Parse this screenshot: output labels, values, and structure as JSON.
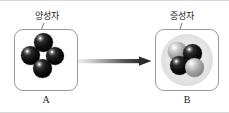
{
  "figure": {
    "type": "science-diagram",
    "background_color": "#ffffff",
    "border_color": "#d8d8d8"
  },
  "callouts": [
    {
      "id": "proton",
      "text": "양성자",
      "points_to": "panel-a-top-sphere",
      "color": "#1a1a1a"
    },
    {
      "id": "neutron",
      "text": "중성자",
      "points_to": "panel-b-top-left-sphere",
      "color": "#1a1a1a"
    }
  ],
  "panels": [
    {
      "id": "a",
      "caption": "A",
      "border_color": "#9a9a9a",
      "has_halo": false,
      "particles": [
        {
          "position": "top",
          "type": "proton",
          "color": "#000000"
        },
        {
          "position": "left",
          "type": "proton",
          "color": "#000000"
        },
        {
          "position": "right",
          "type": "proton",
          "color": "#000000"
        },
        {
          "position": "bottom",
          "type": "proton",
          "color": "#000000"
        }
      ]
    },
    {
      "id": "b",
      "caption": "B",
      "border_color": "#9a9a9a",
      "has_halo": true,
      "halo_color": "#e6e6e6",
      "particles": [
        {
          "position": "top-left",
          "type": "neutron",
          "color": "#8c8c8c"
        },
        {
          "position": "top-right",
          "type": "proton",
          "color": "#000000"
        },
        {
          "position": "bottom-left",
          "type": "proton",
          "color": "#000000"
        },
        {
          "position": "bottom-right",
          "type": "neutron",
          "color": "#8c8c8c"
        }
      ]
    }
  ],
  "arrow": {
    "direction": "left-to-right",
    "gradient_from": "#e8e8e8",
    "gradient_to": "#2b2b2b",
    "label": ""
  },
  "icons": {
    "arrow": "arrow-right-icon",
    "particle": "sphere-icon"
  }
}
